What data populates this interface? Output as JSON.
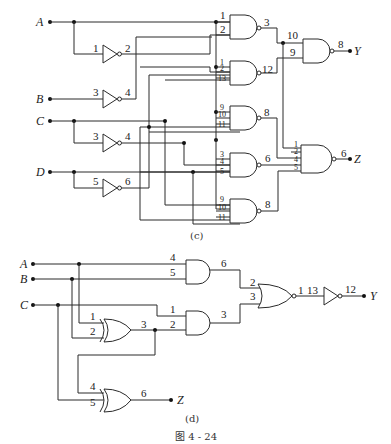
{
  "figure": {
    "title": "图 4 - 24",
    "subfigures": [
      {
        "caption": "(c)",
        "inputs": [
          "A",
          "B",
          "C",
          "D"
        ],
        "outputs": [
          "Y",
          "Z"
        ],
        "gates": [
          {
            "type": "NOT",
            "in_pin": "1",
            "out_pin": "2",
            "input": "A"
          },
          {
            "type": "NOT",
            "in_pin": "3",
            "out_pin": "4",
            "input": "B"
          },
          {
            "type": "NOT",
            "in_pin": "3",
            "out_pin": "4",
            "input": "C"
          },
          {
            "type": "NOT",
            "in_pin": "5",
            "out_pin": "6",
            "input": "D"
          },
          {
            "type": "NAND",
            "in_pins": [
              "1",
              "2"
            ],
            "out_pin": "3"
          },
          {
            "type": "NAND",
            "in_pins": [
              "1",
              "2",
              "13"
            ],
            "out_pin": "12"
          },
          {
            "type": "NAND",
            "in_pins": [
              "9",
              "10",
              "11"
            ],
            "out_pin": "8"
          },
          {
            "type": "NAND",
            "in_pins": [
              "3",
              "4",
              "5"
            ],
            "out_pin": "6"
          },
          {
            "type": "NAND",
            "in_pins": [
              "9",
              "10",
              "11"
            ],
            "out_pin": "8"
          },
          {
            "type": "NAND",
            "in_pins": [
              "10",
              "9"
            ],
            "out_pin": "8",
            "output": "Y"
          },
          {
            "type": "NAND",
            "in_pins": [
              "1",
              "2",
              "4",
              "5"
            ],
            "out_pin": "6",
            "output": "Z"
          }
        ]
      },
      {
        "caption": "(d)",
        "inputs": [
          "A",
          "B",
          "C"
        ],
        "outputs": [
          "Y",
          "Z"
        ],
        "gates": [
          {
            "type": "AND",
            "in_pins": [
              "4",
              "5"
            ],
            "out_pin": "6"
          },
          {
            "type": "XOR",
            "in_pins": [
              "1",
              "2"
            ],
            "out_pin": "3"
          },
          {
            "type": "AND",
            "in_pins": [
              "1",
              "2"
            ],
            "out_pin": "3"
          },
          {
            "type": "NOR",
            "in_pins": [
              "2",
              "3"
            ],
            "out_pin": "1"
          },
          {
            "type": "NOT",
            "in_pin": "13",
            "out_pin": "12",
            "output": "Y"
          },
          {
            "type": "XOR",
            "in_pins": [
              "4",
              "5"
            ],
            "out_pin": "6",
            "output": "Z"
          }
        ]
      }
    ]
  },
  "labels": {
    "c": {
      "A": "A",
      "B": "B",
      "C": "C",
      "D": "D",
      "Y": "Y",
      "Z": "Z",
      "n1_in": "1",
      "n1_out": "2",
      "n2_in": "3",
      "n2_out": "4",
      "n3_in": "3",
      "n3_out": "4",
      "n4_in": "5",
      "n4_out": "6",
      "g1_a": "1",
      "g1_b": "2",
      "g1_out": "3",
      "g2_a": "1",
      "g2_b": "2",
      "g2_c": "13",
      "g2_out": "12",
      "g3_a": "9",
      "g3_b": "10",
      "g3_c": "11",
      "g3_out": "8",
      "g4_a": "3",
      "g4_b": "4",
      "g4_c": "5",
      "g4_out": "6",
      "g5_a": "9",
      "g5_b": "10",
      "g5_c": "11",
      "g5_out": "8",
      "gy_a": "10",
      "gy_b": "9",
      "gy_out": "8",
      "gz_a": "1",
      "gz_b": "2",
      "gz_c": "4",
      "gz_d": "5",
      "gz_out": "6",
      "caption": "(c)"
    },
    "d": {
      "A": "A",
      "B": "B",
      "C": "C",
      "Y": "Y",
      "Z": "Z",
      "and1_a": "4",
      "and1_b": "5",
      "and1_out": "6",
      "xor1_a": "1",
      "xor1_b": "2",
      "xor1_out": "3",
      "and2_a": "1",
      "and2_b": "2",
      "and2_out": "3",
      "nor_a": "2",
      "nor_b": "3",
      "nor_out": "1",
      "not_in": "13",
      "not_out": "12",
      "xor2_a": "4",
      "xor2_b": "5",
      "xor2_out": "6",
      "caption": "(d)"
    },
    "figure_title": "图 4 - 24"
  }
}
